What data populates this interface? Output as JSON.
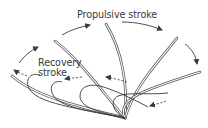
{
  "diagram": {
    "labels": {
      "propulsive": "Propulsive stroke",
      "recovery_line1": "Recovery",
      "recovery_line2": "stroke"
    },
    "colors": {
      "stroke": "#3a3a3a",
      "cilium_outline": "#555555",
      "cilium_fill": "#ffffff",
      "background": "#ffffff"
    },
    "elements": {
      "propulsive_cilia_count": 5,
      "recovery_cilia_count": 4,
      "solid_arrows": 4,
      "dashed_arrows": 4
    }
  }
}
